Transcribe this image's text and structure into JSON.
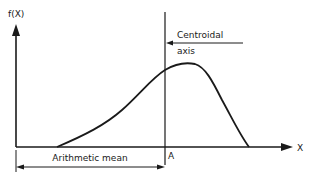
{
  "diagram": {
    "y_axis_label": "f(X)",
    "x_axis_label": "X",
    "centroid_label_line1": "Centroidal",
    "centroid_label_line2": "axis",
    "point_label": "A",
    "dimension_label": "Arithmetic mean",
    "colors": {
      "ink": "#1a1a1a",
      "background": "#ffffff"
    },
    "curve": {
      "description": "Skewed bell-shaped frequency curve f(X), rising from left, peak slightly right of centroidal axis, falling steeply on right",
      "start": [
        57,
        147
      ],
      "peak": [
        187,
        65
      ],
      "end": [
        249,
        147
      ]
    }
  }
}
